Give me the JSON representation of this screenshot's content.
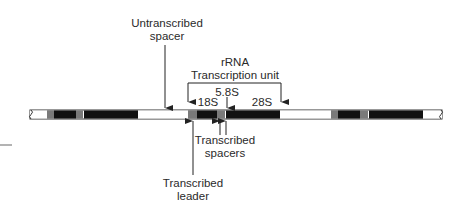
{
  "diagram": {
    "type": "rDNA tandem repeat map",
    "labels": {
      "untranscribed_spacer": [
        "Untranscribed",
        "spacer"
      ],
      "transcription_unit": [
        "rRNA",
        "Transcription unit"
      ],
      "s18": "18S",
      "s58": "5.8S",
      "s28": "28S",
      "transcribed_spacers": [
        "Transcribed",
        "spacers"
      ],
      "transcribed_leader": [
        "Transcribed",
        "leader"
      ]
    },
    "colors": {
      "coding": "#111111",
      "spacer": "#7a7a7a",
      "untranscribed": "#ffffff",
      "outline": "#333333"
    },
    "strand": {
      "x_start": 30,
      "x_end": 442,
      "y": 110,
      "height": 9
    },
    "segments": [
      {
        "kind": "untranscribed",
        "x0": 30,
        "x1": 47
      },
      {
        "kind": "spacer",
        "x0": 47,
        "x1": 54
      },
      {
        "kind": "coding",
        "x0": 54,
        "x1": 76
      },
      {
        "kind": "spacer",
        "x0": 76,
        "x1": 83
      },
      {
        "kind": "coding",
        "x0": 84,
        "x1": 138
      },
      {
        "kind": "untranscribed",
        "x0": 138,
        "x1": 188
      },
      {
        "kind": "spacer",
        "x0": 188,
        "x1": 197
      },
      {
        "kind": "coding",
        "x0": 197,
        "x1": 217
      },
      {
        "kind": "spacer",
        "x0": 217,
        "x1": 225
      },
      {
        "kind": "coding",
        "x0": 226,
        "x1": 280
      },
      {
        "kind": "untranscribed",
        "x0": 280,
        "x1": 331
      },
      {
        "kind": "spacer",
        "x0": 331,
        "x1": 338
      },
      {
        "kind": "coding",
        "x0": 338,
        "x1": 360
      },
      {
        "kind": "spacer",
        "x0": 360,
        "x1": 368
      },
      {
        "kind": "coding",
        "x0": 369,
        "x1": 423
      },
      {
        "kind": "untranscribed",
        "x0": 423,
        "x1": 442
      }
    ]
  }
}
